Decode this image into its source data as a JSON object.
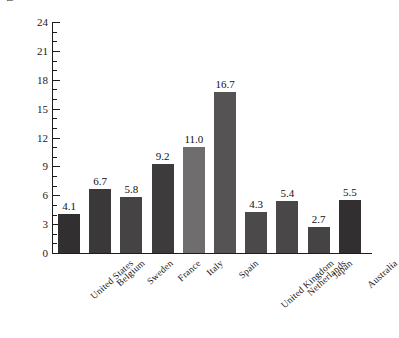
{
  "chart_data": {
    "type": "bar",
    "title": "",
    "subtitle": "",
    "xlabel": "",
    "ylabel": "Unemployment rate",
    "ylim": [
      0,
      24
    ],
    "ytick_step": 3,
    "yminor_step": 1,
    "grid": false,
    "legend": null,
    "categories": [
      "United States",
      "Belgium",
      "Sweden",
      "France",
      "Italy",
      "Spain",
      "United Kingdom",
      "Netherlands",
      "Japan",
      "Australia"
    ],
    "values": [
      4.1,
      6.7,
      5.8,
      9.2,
      11.0,
      16.7,
      4.3,
      5.4,
      2.7,
      5.5
    ],
    "value_labels": [
      "4.1",
      "6.7",
      "5.8",
      "9.2",
      "11.0",
      "16.7",
      "4.3",
      "5.4",
      "2.7",
      "5.5"
    ],
    "bar_colors": [
      "#322f30",
      "#3b3839",
      "#464345",
      "#3e3b3c",
      "#6f6d6e",
      "#565355",
      "#4c494b",
      "#4a4749",
      "#464345",
      "#322f30"
    ],
    "ytick_labels": [
      "0",
      "3",
      "6",
      "9",
      "12",
      "15",
      "18",
      "21",
      "24"
    ],
    "ytick_values": [
      0,
      3,
      6,
      9,
      12,
      15,
      18,
      21,
      24
    ],
    "axis_color": "#1d1d1d"
  }
}
